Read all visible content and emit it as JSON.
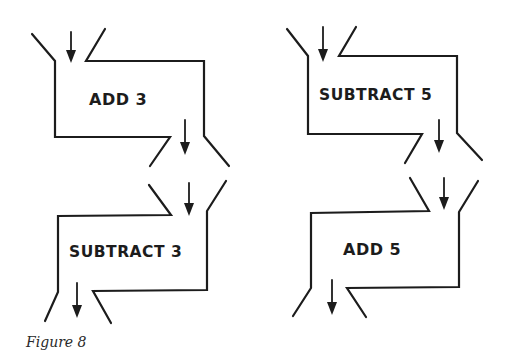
{
  "figure": {
    "caption": "Figure 8"
  },
  "boxes": [
    {
      "id": "top-left",
      "label": "ADD 3",
      "operation": "add",
      "value": 3
    },
    {
      "id": "top-right",
      "label": "SUBTRACT 5",
      "operation": "subtract",
      "value": 5
    },
    {
      "id": "bottom-left",
      "label": "SUBTRACT 3",
      "operation": "subtract",
      "value": 3
    },
    {
      "id": "bottom-right",
      "label": "ADD 5",
      "operation": "add",
      "value": 5
    }
  ],
  "colors": {
    "ink": "#1c1c1c",
    "background": "#ffffff"
  }
}
